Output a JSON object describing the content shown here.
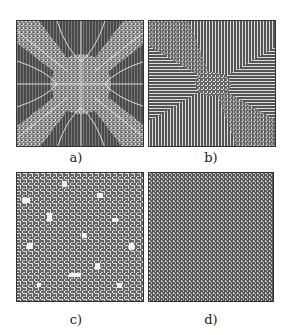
{
  "figure": {
    "panels": [
      {
        "id": "a",
        "caption": "a)",
        "description": "symmetric pattern with diagonal arms radiating from center, dark background with light rays"
      },
      {
        "id": "b",
        "caption": "b)",
        "description": "stripe domains: vertical stripes top/bottom, horizontal stripes left/right, disordered diagonals"
      },
      {
        "id": "c",
        "caption": "c)",
        "description": "disordered labyrinth with light patches"
      },
      {
        "id": "d",
        "caption": "d)",
        "description": "fine-grained disordered labyrinth texture"
      }
    ],
    "colors": {
      "background": "#ffffff",
      "dark": "#444444",
      "light": "#e0e0e0"
    }
  }
}
